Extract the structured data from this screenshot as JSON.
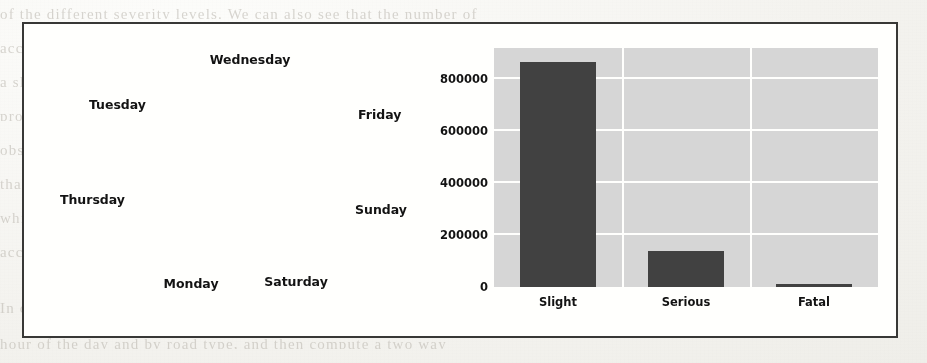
{
  "page": {
    "background_bleed_lines": [
      "of  the  different  severity  levels.  We  can  also  see  that  the  number  of",
      "accidents  is  spread  fairly  evenly  across  the  days  of  the  week,  with",
      "a  slightly  higher  proportion  occurring  on  Fridays  and  a  noticeably  lower",
      "proportion  on  Sundays.  This  is  consistent  with  commuting  traffic  patterns",
      "observed  in  the  previous  chapter.  The  bar  chart  on  the  right  shows",
      "that  the  vast  majority  of  recorded  accidents  are  classified  as  Slight,",
      "while  Serious  accidents  account  for  a  much  smaller  share  and  Fatal",
      "accidents  are  rare  enough  to  be  barely  visible  at  this  scale.",
      "In  order  to  analyse  this  further  we  will  next  group  the  data  by",
      "hour  of  the  day  and  by  road  type,  and  then  compute  a  two  way"
    ]
  },
  "figure": {
    "border_color": "#3a3a38",
    "background_color": "#fbfbf9"
  },
  "chart_data": [
    {
      "type": "pie",
      "title": "",
      "labels": [
        "Friday",
        "Sunday",
        "Saturday",
        "Monday",
        "Thursday",
        "Tuesday",
        "Wednesday"
      ],
      "values": [
        16.4,
        11.1,
        13.6,
        14.2,
        14.9,
        14.9,
        15.1
      ],
      "autopct_labels": [
        "16.4%",
        "11.1%",
        "13.6%",
        "14.2%",
        "14.9%",
        "14.9%",
        "15.1%"
      ],
      "start_angle_deg": 90,
      "direction": "clockwise",
      "slice_colors": [
        "#4a4a4a",
        "#b3b3b3",
        "#5d5d5d",
        "#6f6f6f",
        "#535353",
        "#8f8f8f",
        "#a3a3a3"
      ],
      "wedge_edge_color": "#e8e8e8",
      "legend": "none",
      "label_position": "outside"
    },
    {
      "type": "bar",
      "title": "",
      "categories": [
        "Slight",
        "Serious",
        "Fatal"
      ],
      "values": [
        865000,
        137000,
        10000
      ],
      "xlabel": "",
      "ylabel": "",
      "ylim": [
        0,
        920000
      ],
      "yticks": [
        0,
        200000,
        400000,
        600000,
        800000
      ],
      "ytick_labels": [
        "0",
        "200000",
        "400000",
        "600000",
        "800000"
      ],
      "bar_color": "#434343",
      "axes_facecolor": "#d3d3d3",
      "grid": true,
      "grid_color": "#fbfbf9",
      "legend": "none"
    }
  ],
  "pie_view": {
    "center_x": 228,
    "center_y": 150,
    "radius": 92,
    "pct_radius_frac": 0.62,
    "outside_labels": [
      {
        "name": "Wednesday",
        "left": 226,
        "top": 28,
        "align": "center"
      },
      {
        "name": "Friday",
        "left": 334,
        "top": 83,
        "align": "left"
      },
      {
        "name": "Sunday",
        "left": 331,
        "top": 178,
        "align": "left"
      },
      {
        "name": "Saturday",
        "left": 272,
        "top": 250,
        "align": "center"
      },
      {
        "name": "Monday",
        "left": 167,
        "top": 252,
        "align": "center"
      },
      {
        "name": "Thursday",
        "left": 101,
        "top": 168,
        "align": "right"
      },
      {
        "name": "Tuesday",
        "left": 122,
        "top": 73,
        "align": "right"
      }
    ]
  }
}
